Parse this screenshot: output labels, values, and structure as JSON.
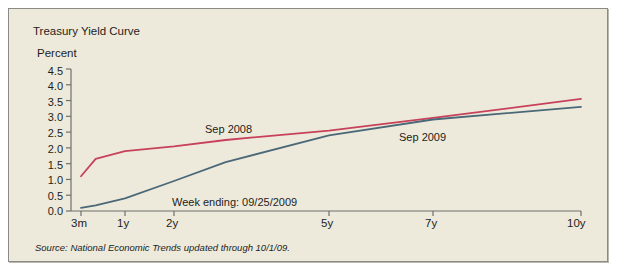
{
  "figure": {
    "title": "Treasury Yield Curve",
    "background_color": "#edeadb",
    "border_color": "#8a8a86",
    "source_prefix": "Source:",
    "source_publication": "National Economic Trends",
    "source_suffix": "updated through 10/1/09.",
    "annotation": "Week ending: 09/25/2009"
  },
  "chart_data": {
    "type": "line",
    "title": "Treasury Yield Curve",
    "xlabel": "",
    "ylabel": "Percent",
    "ylim": [
      0.0,
      4.5
    ],
    "ytick_values": [
      0.0,
      0.5,
      1.0,
      1.5,
      2.0,
      2.5,
      3.0,
      3.5,
      4.0,
      4.5
    ],
    "ytick_labels": [
      "0.0",
      "0.5",
      "1.0",
      "1.5",
      "2.0",
      "2.5",
      "3.0",
      "3.5",
      "4.0",
      "4.5"
    ],
    "categories": [
      "3m",
      "1y",
      "2y",
      "5y",
      "7y",
      "10y"
    ],
    "x_positions_px": [
      72,
      116,
      165,
      320,
      424,
      572
    ],
    "grid": false,
    "legend": "inline-labels",
    "series": [
      {
        "name": "Sep 2008",
        "color": "#c8415a",
        "label_position": {
          "x": 196,
          "y": 114
        },
        "values": [
          1.1,
          1.9,
          2.05,
          2.55,
          2.95,
          3.55
        ],
        "points": [
          {
            "x": "3m",
            "y": 1.1
          },
          {
            "x": "6m",
            "y": 1.65
          },
          {
            "x": "1y",
            "y": 1.9
          },
          {
            "x": "2y",
            "y": 2.05
          },
          {
            "x": "3y",
            "y": 2.25
          },
          {
            "x": "5y",
            "y": 2.55
          },
          {
            "x": "7y",
            "y": 2.95
          },
          {
            "x": "10y",
            "y": 3.55
          }
        ]
      },
      {
        "name": "Sep 2009",
        "color": "#4b6878",
        "label_position": {
          "x": 390,
          "y": 122
        },
        "values": [
          0.1,
          0.4,
          0.95,
          2.4,
          2.9,
          3.3
        ],
        "points": [
          {
            "x": "3m",
            "y": 0.1
          },
          {
            "x": "6m",
            "y": 0.18
          },
          {
            "x": "1y",
            "y": 0.4
          },
          {
            "x": "2y",
            "y": 0.95
          },
          {
            "x": "3y",
            "y": 1.55
          },
          {
            "x": "5y",
            "y": 2.4
          },
          {
            "x": "7y",
            "y": 2.9
          },
          {
            "x": "10y",
            "y": 3.3
          }
        ]
      }
    ]
  }
}
